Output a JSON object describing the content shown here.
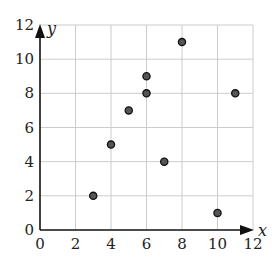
{
  "chart_data": {
    "type": "scatter",
    "title": "",
    "xlabel": "x",
    "ylabel": "y",
    "xlim": [
      0,
      12
    ],
    "ylim": [
      0,
      12
    ],
    "x_ticks": [
      0,
      2,
      4,
      6,
      8,
      10,
      12
    ],
    "y_ticks": [
      0,
      2,
      4,
      6,
      8,
      10,
      12
    ],
    "grid": true,
    "legend": null,
    "points": [
      {
        "x": 3,
        "y": 2
      },
      {
        "x": 4,
        "y": 5
      },
      {
        "x": 5,
        "y": 7
      },
      {
        "x": 6,
        "y": 8
      },
      {
        "x": 6,
        "y": 9
      },
      {
        "x": 7,
        "y": 4
      },
      {
        "x": 8,
        "y": 11
      },
      {
        "x": 10,
        "y": 1
      },
      {
        "x": 11,
        "y": 8
      }
    ],
    "colors": {
      "marker_fill": "#555555",
      "marker_stroke": "#111111",
      "grid": "#cccccc",
      "axis": "#111111"
    }
  }
}
